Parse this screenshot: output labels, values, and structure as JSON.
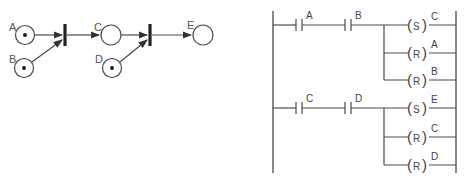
{
  "petri_net": {
    "places": [
      {
        "id": "A",
        "label": "A",
        "token": true
      },
      {
        "id": "B",
        "label": "B",
        "token": true
      },
      {
        "id": "C",
        "label": "C",
        "token": false
      },
      {
        "id": "D",
        "label": "D",
        "token": true
      },
      {
        "id": "E",
        "label": "E",
        "token": false
      }
    ],
    "transitions": [
      {
        "id": "t1",
        "inputs": [
          "A",
          "B"
        ],
        "output": "C"
      },
      {
        "id": "t2",
        "inputs": [
          "C",
          "D"
        ],
        "output": "E"
      }
    ]
  },
  "ladder": {
    "rungs": [
      {
        "contacts": [
          "A",
          "B"
        ],
        "coils": [
          {
            "type": "S",
            "target": "C"
          },
          {
            "type": "R",
            "target": "A"
          },
          {
            "type": "R",
            "target": "B"
          }
        ]
      },
      {
        "contacts": [
          "C",
          "D"
        ],
        "coils": [
          {
            "type": "S",
            "target": "E"
          },
          {
            "type": "R",
            "target": "C"
          },
          {
            "type": "R",
            "target": "D"
          }
        ]
      }
    ]
  }
}
